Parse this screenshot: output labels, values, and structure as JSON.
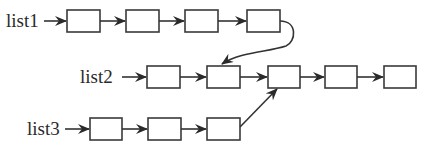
{
  "diagram": {
    "type": "linked-lists-merge",
    "lists": [
      {
        "label": "list1",
        "node_count": 4
      },
      {
        "label": "list2",
        "node_count": 5
      },
      {
        "label": "list3",
        "node_count": 3
      }
    ]
  },
  "colors": {
    "stroke": "#333333",
    "background": "#ffffff"
  }
}
